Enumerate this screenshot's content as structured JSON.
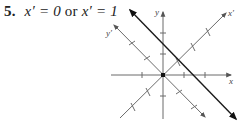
{
  "problem": {
    "number": "5.",
    "lhs1": "x′ = 0",
    "connector": "or",
    "lhs2": "x′ = 1"
  },
  "diagram": {
    "axis_labels": {
      "x": "x",
      "y": "y",
      "x_prime": "x′",
      "y_prime": "y′"
    },
    "colors": {
      "axes": "#6b6b6b",
      "rotated_axes": "#6b6b6b",
      "solution_line": "#1a1a1a",
      "text": "#222222"
    },
    "origin_px": [
      163,
      75
    ],
    "unit_px": 21,
    "standard_axes": {
      "x_ticks": [
        -1,
        1,
        2
      ],
      "y_ticks": [
        2,
        1,
        -1
      ]
    },
    "rotated_axes": {
      "angle_deg": 45,
      "x_prime_ticks": [
        -2,
        -1,
        1,
        2,
        3
      ],
      "y_prime_ticks": [
        -2,
        -1,
        1,
        2
      ]
    },
    "solution_line": {
      "description": "x′ = 1 (line perpendicular to x′ axis)",
      "from_px": [
        130,
        10
      ],
      "to_px": [
        236,
        119
      ]
    },
    "point_at_origin": "x′ = 0"
  }
}
